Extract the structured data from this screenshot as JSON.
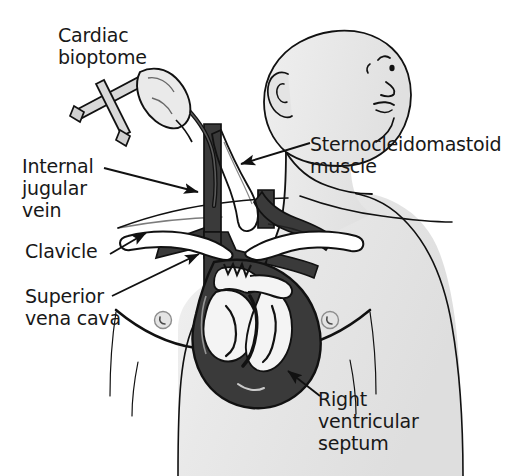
{
  "figure": {
    "style": "black-and-white line drawing, medical illustration",
    "background_color": "#ffffff",
    "skin_fill_color": "#e8e8e8",
    "vessel_fill_color": "#3a3a3a",
    "bone_fill_color": "#ffffff",
    "outline_color": "#111111",
    "text_color": "#181818"
  },
  "labels": {
    "cardiac_bioptome": "Cardiac\nbioptome",
    "internal_jugular_vein": "Internal\njugular\nvein",
    "clavicle": "Clavicle",
    "superior_vena_cava": "Superior\nvena cava",
    "sternocleidomastoid_muscle": "Sternocleidomastoid\nmuscle",
    "right_ventricular_septum": "Right\nventricular\nseptum"
  },
  "anatomy_parts": [
    {
      "name": "head-and-neck",
      "description": "head turned to patient's left, ear and nose/lips visible in profile"
    },
    {
      "name": "torso",
      "description": "upper chest and shoulders with nipples"
    },
    {
      "name": "internal-jugular-vein",
      "description": "dark vertical vein running down the neck"
    },
    {
      "name": "sternocleidomastoid-muscle",
      "description": "strap muscle crossing the neck"
    },
    {
      "name": "clavicle-left",
      "description": "white collarbone crossing in front of vessels"
    },
    {
      "name": "clavicle-right",
      "description": "white collarbone crossing in front of vessels"
    },
    {
      "name": "subclavian-veins",
      "description": "dark horizontal veins behind clavicles"
    },
    {
      "name": "superior-vena-cava",
      "description": "dark vertical great vein entering the right atrium"
    },
    {
      "name": "heart",
      "description": "cutaway heart showing right atrium, right ventricle and septum"
    },
    {
      "name": "right-ventricular-septum",
      "description": "interventricular septum, biopsy target"
    },
    {
      "name": "cardiac-bioptome",
      "description": "scissor-handled biopsy forceps with long flexible catheter"
    },
    {
      "name": "operator-hand",
      "description": "hand gripping the bioptome handles"
    }
  ],
  "pointer_arrows": [
    {
      "name": "arrow-to-internal-jugular-vein",
      "points_to": "internal-jugular-vein"
    },
    {
      "name": "arrow-to-clavicle",
      "points_to": "clavicle-left"
    },
    {
      "name": "arrow-to-superior-vena-cava",
      "points_to": "superior-vena-cava"
    },
    {
      "name": "arrow-to-sternocleidomastoid-muscle",
      "points_to": "sternocleidomastoid-muscle"
    },
    {
      "name": "arrow-to-right-ventricular-septum",
      "points_to": "right-ventricular-septum"
    }
  ]
}
